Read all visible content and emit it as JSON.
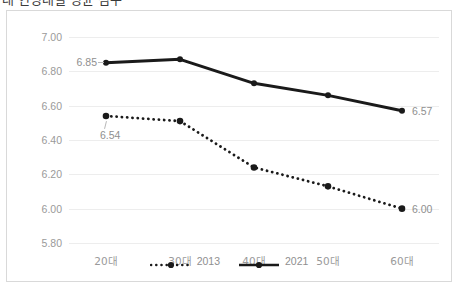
{
  "title": "대 연령대별 평균 점수",
  "chart_data": {
    "type": "line",
    "title": "",
    "xlabel": "",
    "ylabel": "",
    "categories": [
      "20대",
      "30대",
      "40대",
      "50대",
      "60대"
    ],
    "ylim": [
      5.8,
      7.0
    ],
    "ytick_labels": [
      "7.00",
      "6.80",
      "6.60",
      "6.40",
      "6.20",
      "6.00",
      "5.80"
    ],
    "ytick_values": [
      7.0,
      6.8,
      6.6,
      6.4,
      6.2,
      6.0,
      5.8
    ],
    "grid": "horizontal",
    "legend_position": "bottom-center",
    "series": [
      {
        "name": "2013",
        "style": "dotted",
        "color": "#1a1a1a",
        "values": [
          6.54,
          6.51,
          6.24,
          6.13,
          6.0
        ],
        "point_labels": {
          "0": "6.54",
          "4": "6.00"
        }
      },
      {
        "name": "2021",
        "style": "solid",
        "color": "#1a1a1a",
        "values": [
          6.85,
          6.87,
          6.73,
          6.66,
          6.57
        ],
        "point_labels": {
          "0": "6.85",
          "4": "6.57"
        }
      }
    ]
  },
  "legend": [
    {
      "label": "2013"
    },
    {
      "label": "2021"
    }
  ],
  "labels": {
    "s2013_first": "6.54",
    "s2013_last": "6.00",
    "s2021_first": "6.85",
    "s2021_last": "6.57"
  }
}
